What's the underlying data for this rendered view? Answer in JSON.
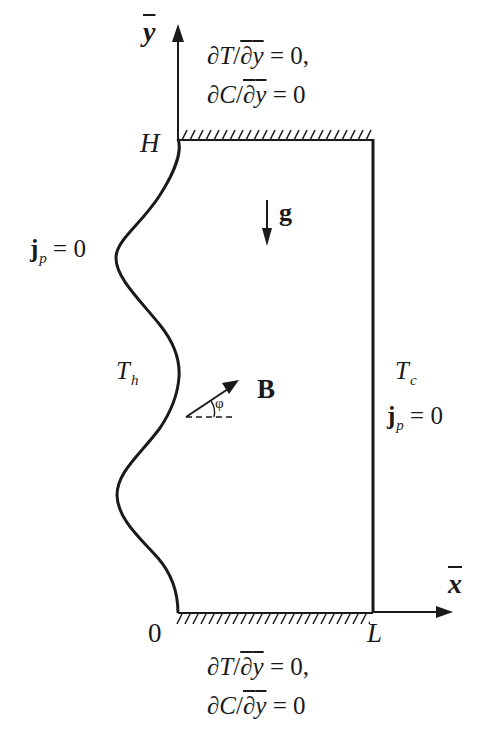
{
  "diagram": {
    "axes": {
      "y_label": "y",
      "x_label": "x",
      "origin_label": "0",
      "height_label": "H",
      "length_label": "L"
    },
    "top_boundary": {
      "line1": {
        "d": "∂",
        "var": "T",
        "slash": "/",
        "d2": "∂",
        "den": "y",
        "rhs": " = 0,"
      },
      "line2": {
        "d": "∂",
        "var": "C",
        "slash": "/",
        "d2": "∂",
        "den": "y",
        "rhs": " = 0"
      }
    },
    "bottom_boundary": {
      "line1": {
        "d": "∂",
        "var": "T",
        "slash": "/",
        "d2": "∂",
        "den": "y",
        "rhs": " = 0,"
      },
      "line2": {
        "d": "∂",
        "var": "C",
        "slash": "/",
        "d2": "∂",
        "den": "y",
        "rhs": " = 0"
      }
    },
    "left_wall": {
      "temperature": {
        "base": "T",
        "sub": "h"
      },
      "current": {
        "base": "j",
        "sub": "p",
        "rhs": " = 0"
      }
    },
    "right_wall": {
      "temperature": {
        "base": "T",
        "sub": "c"
      },
      "current": {
        "base": "j",
        "sub": "p",
        "rhs": " = 0"
      }
    },
    "gravity": {
      "label": "g"
    },
    "magnetic_field": {
      "label": "B",
      "angle_label": "φ"
    },
    "colors": {
      "stroke": "#1a1a1a",
      "background": "#ffffff"
    }
  }
}
